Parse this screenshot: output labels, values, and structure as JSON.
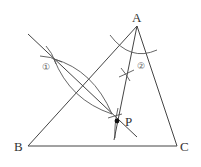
{
  "diagram": {
    "type": "geometric-construction",
    "colors": {
      "stroke": "#444444",
      "text": "#333333",
      "background": "#ffffff"
    },
    "points": {
      "A": {
        "label": "A",
        "x": 137,
        "y": 26
      },
      "B": {
        "label": "B",
        "x": 28,
        "y": 146
      },
      "C": {
        "label": "C",
        "x": 177,
        "y": 146
      },
      "P": {
        "label": "P",
        "x": 117,
        "y": 121
      }
    },
    "markers": {
      "step1": {
        "label": "①"
      },
      "step2": {
        "label": "②"
      }
    },
    "constructions": [
      {
        "name": "perpendicular-bisector-of-AB",
        "marker": "①"
      },
      {
        "name": "angle-bisector-of-angle-A",
        "marker": "②"
      }
    ]
  }
}
